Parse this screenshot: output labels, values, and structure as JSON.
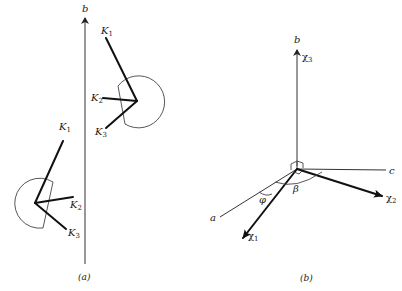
{
  "panel_a": {
    "caption": "(a)",
    "axis_label": "b",
    "upper_assembly": {
      "k1": "K",
      "k1_sub": "1",
      "k2": "K",
      "k2_sub": "2",
      "k3": "K",
      "k3_sub": "3"
    },
    "lower_assembly": {
      "k1": "K",
      "k1_sub": "1",
      "k2": "K",
      "k2_sub": "2",
      "k3": "K",
      "k3_sub": "3"
    }
  },
  "panel_b": {
    "caption": "(b)",
    "axis_b": "b",
    "axis_a": "a",
    "axis_c": "c",
    "chi3": "χ",
    "chi3_sub": "3",
    "chi2": "χ",
    "chi2_sub": "2",
    "chi1": "χ",
    "chi1_sub": "1",
    "angle_phi": "φ",
    "angle_beta": "β"
  },
  "colors": {
    "ink": "#111111",
    "background": "#ffffff"
  }
}
